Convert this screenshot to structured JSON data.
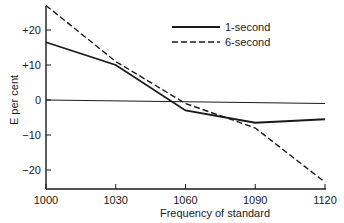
{
  "chart_data": {
    "type": "line",
    "title": "",
    "xlabel": "Frequency of standard",
    "ylabel": "E per cent",
    "x": [
      1000,
      1030,
      1060,
      1090,
      1120
    ],
    "xticks": [
      "1000",
      "1030",
      "1060",
      "1090",
      "1120"
    ],
    "yticks": [
      {
        "value": 20,
        "label": "+20"
      },
      {
        "value": 10,
        "label": "+10"
      },
      {
        "value": 0,
        "label": "0"
      },
      {
        "value": -10,
        "label": "−10"
      },
      {
        "value": -20,
        "label": "−20"
      }
    ],
    "xlim": [
      1000,
      1120
    ],
    "ylim": [
      -25.5,
      28
    ],
    "grid": false,
    "reference_line": {
      "y": 0,
      "y_end": -1
    },
    "legend_position": "upper right",
    "series": [
      {
        "name": "1-second",
        "style": "solid",
        "values": [
          16.5,
          10,
          -3,
          -6.5,
          -5.5
        ]
      },
      {
        "name": "6-second",
        "style": "dashed",
        "values": [
          27,
          11,
          -1,
          -8,
          -23.5
        ]
      }
    ],
    "colors": {
      "line": "#1a1a1a",
      "axis": "#1a1a1a",
      "background": "#ffffff"
    }
  }
}
